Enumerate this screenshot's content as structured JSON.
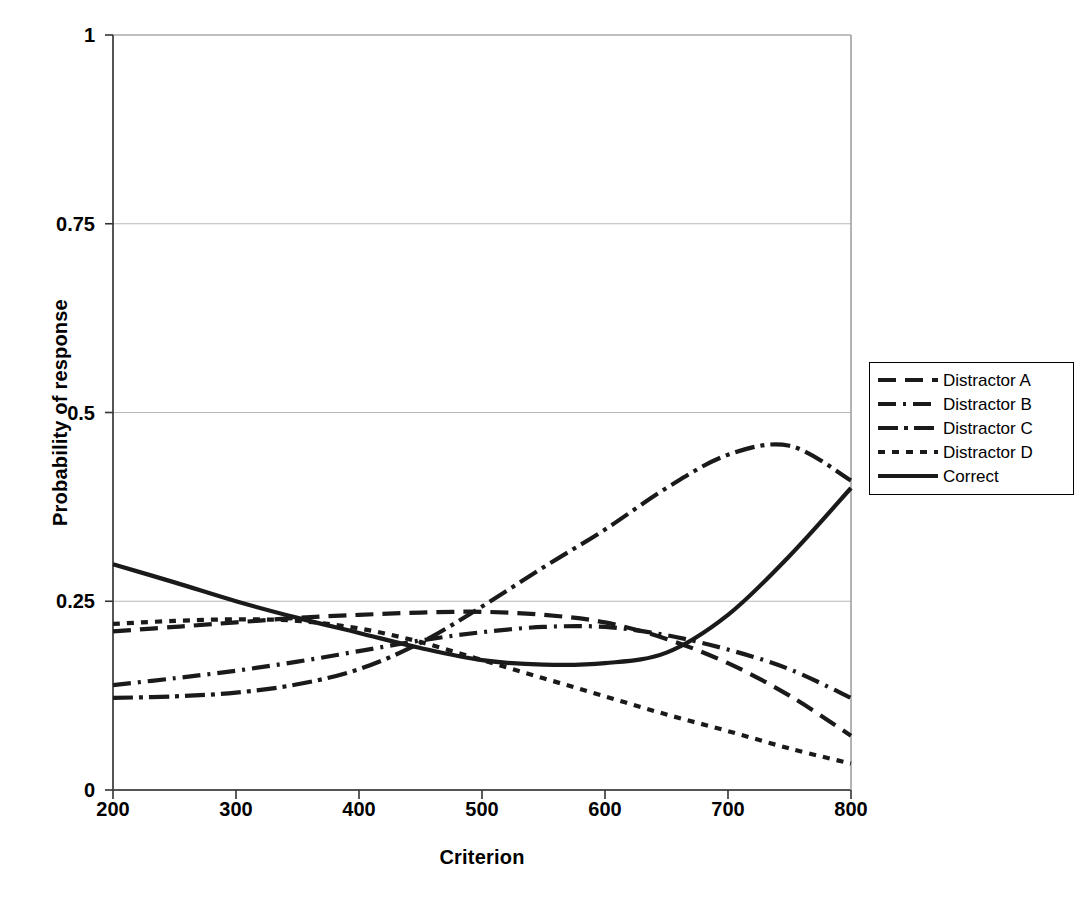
{
  "chart_data": {
    "type": "line",
    "title": "",
    "xlabel": "Criterion",
    "ylabel": "Probability of response",
    "xlim": [
      200,
      800
    ],
    "ylim": [
      0,
      1
    ],
    "xticks": [
      "200",
      "300",
      "400",
      "500",
      "600",
      "700",
      "800"
    ],
    "xtick_values": [
      200,
      300,
      400,
      500,
      600,
      700,
      800
    ],
    "yticks": [
      "0",
      "0.25",
      "0.5",
      "0.75",
      "1"
    ],
    "ytick_values": [
      0,
      0.25,
      0.5,
      0.75,
      1
    ],
    "grid": "horizontal",
    "legend_position": "right",
    "x": [
      200,
      250,
      300,
      350,
      400,
      450,
      500,
      550,
      600,
      650,
      700,
      750,
      800
    ],
    "series": [
      {
        "name": "Distractor A",
        "style": "long-dash",
        "dash": "18,9",
        "values": [
          0.21,
          0.216,
          0.222,
          0.228,
          0.232,
          0.235,
          0.236,
          0.232,
          0.222,
          0.2,
          0.168,
          0.125,
          0.072
        ]
      },
      {
        "name": "Distractor B",
        "style": "dash-dot",
        "dash": "18,7,3,7",
        "values": [
          0.139,
          0.148,
          0.158,
          0.17,
          0.184,
          0.198,
          0.209,
          0.216,
          0.216,
          0.205,
          0.186,
          0.16,
          0.122
        ]
      },
      {
        "name": "Distractor C",
        "style": "dash-dot-long",
        "dash": "20,6,4,6",
        "values": [
          0.122,
          0.124,
          0.129,
          0.14,
          0.16,
          0.195,
          0.243,
          0.295,
          0.345,
          0.4,
          0.444,
          0.456,
          0.41
        ]
      },
      {
        "name": "Distractor D",
        "style": "dotted",
        "dash": "7,7",
        "values": [
          0.22,
          0.224,
          0.226,
          0.224,
          0.214,
          0.196,
          0.172,
          0.148,
          0.124,
          0.1,
          0.078,
          0.055,
          0.035
        ]
      },
      {
        "name": "Correct",
        "style": "solid",
        "dash": "",
        "values": [
          0.299,
          0.275,
          0.25,
          0.228,
          0.208,
          0.188,
          0.172,
          0.166,
          0.168,
          0.182,
          0.232,
          0.31,
          0.4
        ]
      }
    ]
  },
  "axis": {
    "xlabel": "Criterion",
    "ylabel": "Probability of response"
  },
  "legend": {
    "items": [
      {
        "label": "Distractor A"
      },
      {
        "label": "Distractor B"
      },
      {
        "label": "Distractor C"
      },
      {
        "label": "Distractor D"
      },
      {
        "label": "Correct"
      }
    ]
  }
}
